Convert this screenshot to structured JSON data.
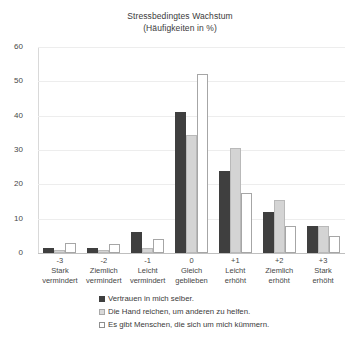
{
  "chart_data": {
    "type": "bar",
    "title": "Stressbedingtes Wachstum",
    "subtitle": "(Häufigkeiten in %)",
    "xlabel": "",
    "ylabel": "",
    "ylim": [
      0,
      60
    ],
    "yticks": [
      0,
      10,
      20,
      30,
      40,
      50,
      60
    ],
    "grid": true,
    "legend_position": "bottom",
    "categories": [
      "-3",
      "-2",
      "-1",
      "0",
      "+1",
      "+2",
      "+3"
    ],
    "category_labels": [
      [
        "Stark",
        "vermindert"
      ],
      [
        "Ziemlich",
        "vermindert"
      ],
      [
        "Leicht",
        "vermindert"
      ],
      [
        "Gleich",
        "geblieben"
      ],
      [
        "Leicht",
        "erhöht"
      ],
      [
        "Ziemlich",
        "erhöht"
      ],
      [
        "Stark",
        "erhöht"
      ]
    ],
    "series": [
      {
        "name": "Vertrauen in mich selber.",
        "color": "#3f3f3f",
        "values": [
          1.5,
          1.5,
          6,
          41,
          24,
          12,
          8
        ]
      },
      {
        "name": "Die Hand reichen, um anderen zu helfen.",
        "color": "#d4d4d4",
        "values": [
          1,
          1,
          1.5,
          34.5,
          30.5,
          15.5,
          8
        ]
      },
      {
        "name": "Es gibt Menschen, die sich um mich kümmern.",
        "color": "#ffffff",
        "values": [
          3,
          2.5,
          4,
          52,
          17.5,
          8,
          5
        ]
      }
    ]
  }
}
